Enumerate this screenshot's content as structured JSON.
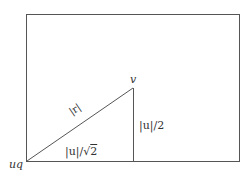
{
  "diagram": {
    "type": "geometry-figure",
    "colors": {
      "stroke": "#555555",
      "text": "#333333",
      "background": "#ffffff"
    },
    "rectangle": {
      "x": 26,
      "y": 14,
      "width": 213,
      "height": 147
    },
    "triangle": {
      "vertices": [
        {
          "name": "uq",
          "x": 27,
          "y": 161
        },
        {
          "name": "v",
          "x": 133,
          "y": 88
        },
        {
          "name": "foot",
          "x": 133,
          "y": 161
        }
      ]
    },
    "labels": {
      "vertex_bottom_left": "uq",
      "vertex_apex": "v",
      "hypotenuse": "|r|",
      "vertical_side": "|u|/2",
      "base_prefix": "|u|/",
      "base_sqrt_symbol": "√",
      "base_sqrt_arg": "2"
    }
  }
}
